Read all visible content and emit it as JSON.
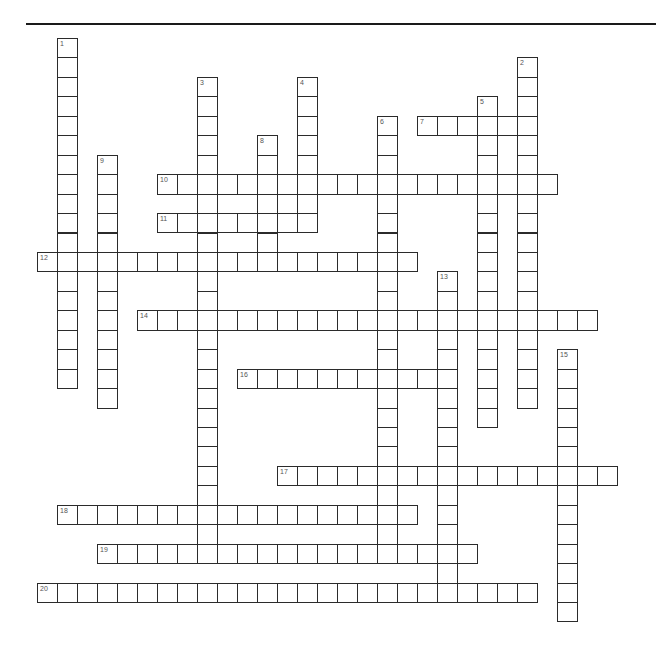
{
  "puzzle": {
    "grid": {
      "origin_x": 37,
      "origin_y": 38,
      "cell_w": 20,
      "cell_h": 19.45
    },
    "words": [
      {
        "number": "1",
        "direction": "down",
        "col": 1,
        "row": 0,
        "length": 18
      },
      {
        "number": "2",
        "direction": "down",
        "col": 24,
        "row": 1,
        "length": 18
      },
      {
        "number": "3",
        "direction": "down",
        "col": 8,
        "row": 2,
        "length": 25
      },
      {
        "number": "4",
        "direction": "down",
        "col": 13,
        "row": 2,
        "length": 8
      },
      {
        "number": "5",
        "direction": "down",
        "col": 22,
        "row": 3,
        "length": 17
      },
      {
        "number": "6",
        "direction": "down",
        "col": 17,
        "row": 4,
        "length": 23
      },
      {
        "number": "7",
        "direction": "across",
        "col": 19,
        "row": 4,
        "length": 6
      },
      {
        "number": "8",
        "direction": "down",
        "col": 11,
        "row": 5,
        "length": 7
      },
      {
        "number": "9",
        "direction": "down",
        "col": 3,
        "row": 6,
        "length": 13
      },
      {
        "number": "10",
        "direction": "across",
        "col": 6,
        "row": 7,
        "length": 20
      },
      {
        "number": "11",
        "direction": "across",
        "col": 6,
        "row": 9,
        "length": 8
      },
      {
        "number": "12",
        "direction": "across",
        "col": 0,
        "row": 11,
        "length": 19
      },
      {
        "number": "13",
        "direction": "down",
        "col": 20,
        "row": 12,
        "length": 17
      },
      {
        "number": "14",
        "direction": "across",
        "col": 5,
        "row": 14,
        "length": 23
      },
      {
        "number": "15",
        "direction": "down",
        "col": 26,
        "row": 16,
        "length": 14
      },
      {
        "number": "16",
        "direction": "across",
        "col": 10,
        "row": 17,
        "length": 11
      },
      {
        "number": "17",
        "direction": "across",
        "col": 12,
        "row": 22,
        "length": 17
      },
      {
        "number": "18",
        "direction": "across",
        "col": 1,
        "row": 24,
        "length": 18
      },
      {
        "number": "19",
        "direction": "across",
        "col": 3,
        "row": 26,
        "length": 19
      },
      {
        "number": "20",
        "direction": "across",
        "col": 0,
        "row": 28,
        "length": 25
      }
    ]
  },
  "colors": {
    "line": "#2b2b2b",
    "number": "#555555",
    "background": "#ffffff"
  }
}
